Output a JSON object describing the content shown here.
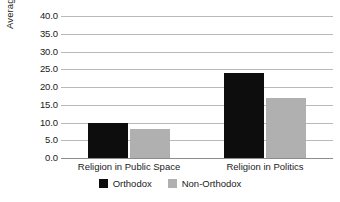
{
  "chart_data": {
    "type": "bar",
    "title": "",
    "subtitle": "",
    "xlabel": "",
    "ylabel": "Average Score",
    "categories": [
      "Religion in Public Space",
      "Religion in Politics"
    ],
    "series": [
      {
        "name": "Orthodox",
        "color": "#0d0d0d",
        "values": [
          10.0,
          24.0
        ]
      },
      {
        "name": "Non-Orthodox",
        "color": "#b0b0b0",
        "values": [
          8.3,
          16.8
        ]
      }
    ],
    "ylim": [
      0.0,
      40.0
    ],
    "ytick_step": 5.0,
    "ytick_labels": [
      "40.0",
      "35.0",
      "30.0",
      "25.0",
      "20.0",
      "15.0",
      "10.0",
      "5.0",
      "0.0"
    ],
    "ytick_values": [
      40.0,
      35.0,
      30.0,
      25.0,
      20.0,
      15.0,
      10.0,
      5.0,
      0.0
    ],
    "grid": true,
    "grid_axis": "y",
    "grid_color": "#b9b9b9",
    "legend": true,
    "legend_position": "bottom"
  },
  "axis": {
    "y_title": "Average Score"
  },
  "legend": {
    "items": [
      {
        "label": "Orthodox",
        "color": "#0d0d0d"
      },
      {
        "label": "Non-Orthodox",
        "color": "#b0b0b0"
      }
    ]
  }
}
